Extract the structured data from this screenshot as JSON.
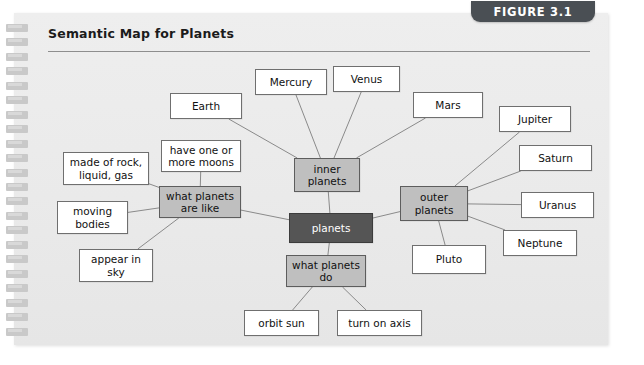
{
  "figure": {
    "tab_label": "FIGURE 3.1",
    "title": "Semantic Map for Planets",
    "tab_color": "#4a4f54",
    "panel_color": "#ebebeb"
  },
  "chart_data": {
    "type": "diagram",
    "title": "Semantic Map for Planets",
    "layout": "radial semantic map / concept web",
    "root": "planets",
    "node_styles": {
      "root": {
        "fill": "#555555",
        "text": "#ffffff"
      },
      "category": {
        "fill": "#bfbfbf",
        "text": "#111111"
      },
      "leaf": {
        "fill": "#ffffff",
        "text": "#111111"
      }
    },
    "nodes": [
      {
        "id": "planets",
        "label": "planets",
        "style": "root",
        "x": 289,
        "y": 213,
        "w": 84,
        "h": 30
      },
      {
        "id": "inner",
        "label": "inner\nplanets",
        "style": "category",
        "x": 294,
        "y": 158,
        "w": 66,
        "h": 34
      },
      {
        "id": "outer",
        "label": "outer\nplanets",
        "style": "category",
        "x": 400,
        "y": 186,
        "w": 68,
        "h": 35
      },
      {
        "id": "like",
        "label": "what planets\nare like",
        "style": "category",
        "x": 159,
        "y": 186,
        "w": 82,
        "h": 32
      },
      {
        "id": "do",
        "label": "what planets\ndo",
        "style": "category",
        "x": 286,
        "y": 255,
        "w": 80,
        "h": 32
      },
      {
        "id": "earth",
        "label": "Earth",
        "style": "leaf",
        "x": 170,
        "y": 93,
        "w": 72,
        "h": 26
      },
      {
        "id": "mercury",
        "label": "Mercury",
        "style": "leaf",
        "x": 255,
        "y": 69,
        "w": 72,
        "h": 26
      },
      {
        "id": "venus",
        "label": "Venus",
        "style": "leaf",
        "x": 333,
        "y": 66,
        "w": 67,
        "h": 26
      },
      {
        "id": "mars",
        "label": "Mars",
        "style": "leaf",
        "x": 413,
        "y": 92,
        "w": 70,
        "h": 26
      },
      {
        "id": "jupiter",
        "label": "Jupiter",
        "style": "leaf",
        "x": 499,
        "y": 106,
        "w": 72,
        "h": 26
      },
      {
        "id": "saturn",
        "label": "Saturn",
        "style": "leaf",
        "x": 519,
        "y": 145,
        "w": 73,
        "h": 26
      },
      {
        "id": "uranus",
        "label": "Uranus",
        "style": "leaf",
        "x": 521,
        "y": 192,
        "w": 73,
        "h": 26
      },
      {
        "id": "neptune",
        "label": "Neptune",
        "style": "leaf",
        "x": 503,
        "y": 230,
        "w": 74,
        "h": 26
      },
      {
        "id": "pluto",
        "label": "Pluto",
        "style": "leaf",
        "x": 412,
        "y": 245,
        "w": 74,
        "h": 29
      },
      {
        "id": "moons",
        "label": "have one or\nmore moons",
        "style": "leaf",
        "x": 161,
        "y": 140,
        "w": 80,
        "h": 32
      },
      {
        "id": "made_of",
        "label": "made of rock,\nliquid, gas",
        "style": "leaf",
        "x": 63,
        "y": 152,
        "w": 86,
        "h": 33
      },
      {
        "id": "moving",
        "label": "moving\nbodies",
        "style": "leaf",
        "x": 57,
        "y": 201,
        "w": 71,
        "h": 33
      },
      {
        "id": "appear",
        "label": "appear in\nsky",
        "style": "leaf",
        "x": 79,
        "y": 249,
        "w": 74,
        "h": 33
      },
      {
        "id": "orbit_sun",
        "label": "orbit sun",
        "style": "leaf",
        "x": 244,
        "y": 310,
        "w": 75,
        "h": 26
      },
      {
        "id": "turn_on_axis",
        "label": "turn on axis",
        "style": "leaf",
        "x": 337,
        "y": 310,
        "w": 85,
        "h": 26
      }
    ],
    "edges": [
      [
        "planets",
        "inner"
      ],
      [
        "planets",
        "outer"
      ],
      [
        "planets",
        "like"
      ],
      [
        "planets",
        "do"
      ],
      [
        "inner",
        "earth"
      ],
      [
        "inner",
        "mercury"
      ],
      [
        "inner",
        "venus"
      ],
      [
        "inner",
        "mars"
      ],
      [
        "outer",
        "jupiter"
      ],
      [
        "outer",
        "saturn"
      ],
      [
        "outer",
        "uranus"
      ],
      [
        "outer",
        "neptune"
      ],
      [
        "outer",
        "pluto"
      ],
      [
        "like",
        "moons"
      ],
      [
        "like",
        "made_of"
      ],
      [
        "like",
        "moving"
      ],
      [
        "like",
        "appear"
      ],
      [
        "do",
        "orbit_sun"
      ],
      [
        "do",
        "turn_on_axis"
      ]
    ],
    "edge_color": "#8a8a8a"
  },
  "spiral": {
    "ring_count": 22
  }
}
